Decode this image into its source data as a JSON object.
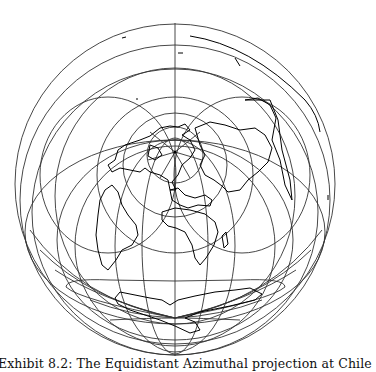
{
  "figure": {
    "caption": "Exhibit 8.2: The Equidistant Azimuthal projection at Chile",
    "projection": "Equidistant Azimuthal",
    "colors": {
      "graticule": "#333333",
      "coastline": "#000000",
      "background": "#ffffff"
    }
  }
}
